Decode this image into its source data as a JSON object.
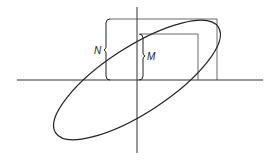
{
  "diagram": {
    "type": "lissajous-ellipse",
    "labels": {
      "outer": "N",
      "inner": "M"
    },
    "colors": {
      "stroke": "#222222",
      "background": "#ffffff"
    }
  }
}
